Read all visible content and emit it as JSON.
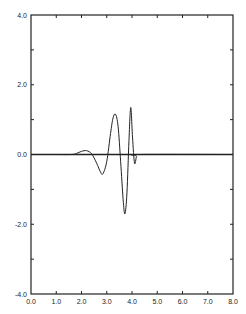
{
  "chart_data": {
    "type": "line",
    "title": "",
    "xlabel": "",
    "ylabel": "",
    "xlim": [
      0.0,
      8.0
    ],
    "ylim": [
      -4.0,
      4.0
    ],
    "grid": false,
    "legend": null,
    "x_ticks": [
      "0.0",
      "1.0",
      "2.0",
      "3.0",
      "4.0",
      "5.0",
      "6.0",
      "7.0",
      "8.0"
    ],
    "y_ticks": [
      "-4.0",
      "-2.0",
      "0.0",
      "2.0",
      "4.0"
    ],
    "baseline": {
      "y": 0.0,
      "from_x": 0.0,
      "to_x": 8.0
    },
    "series": [
      {
        "name": "waveform",
        "color": "#222222",
        "x": [
          0.0,
          1.0,
          1.6,
          1.8,
          2.0,
          2.2,
          2.4,
          2.6,
          2.75,
          2.85,
          3.0,
          3.15,
          3.25,
          3.35,
          3.45,
          3.55,
          3.65,
          3.72,
          3.8,
          3.88,
          3.95,
          4.02,
          4.1,
          4.18,
          4.25,
          8.0
        ],
        "y": [
          0.0,
          0.0,
          0.0,
          0.03,
          0.09,
          0.11,
          0.02,
          -0.25,
          -0.5,
          -0.55,
          -0.2,
          0.6,
          1.05,
          1.15,
          0.8,
          -0.2,
          -1.3,
          -1.7,
          -1.1,
          0.4,
          1.35,
          0.5,
          -0.25,
          -0.05,
          0.0,
          0.0
        ]
      }
    ]
  }
}
